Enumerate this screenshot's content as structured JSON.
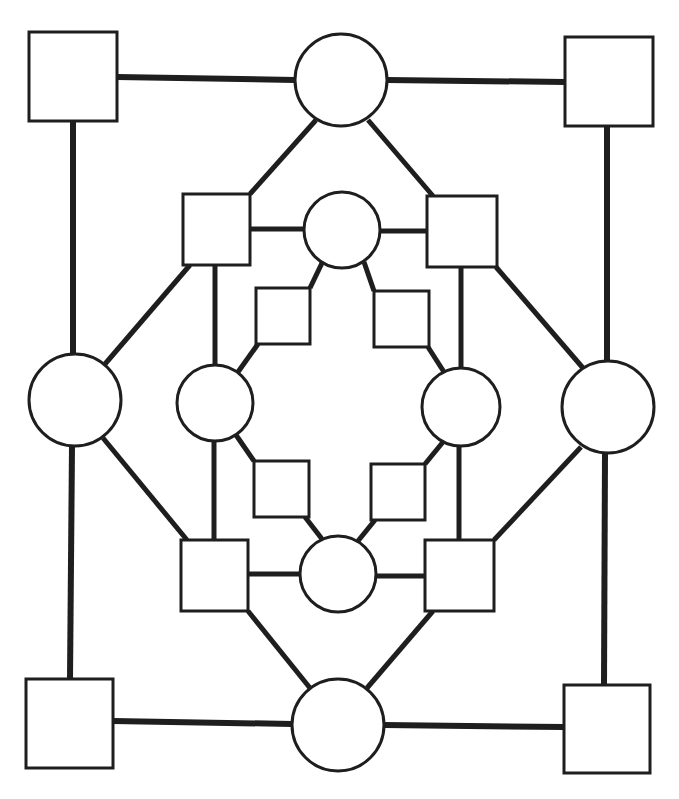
{
  "diagram": {
    "title": "",
    "background": "#ffffff",
    "stroke_color": "#1e1e1e",
    "nodes": [
      {
        "id": "sq-outer-tl",
        "shape": "square",
        "x": 29,
        "y": 32,
        "w": 88,
        "h": 89
      },
      {
        "id": "ci-outer-top",
        "shape": "circle",
        "cx": 341,
        "cy": 80,
        "r": 46
      },
      {
        "id": "sq-outer-tr",
        "shape": "square",
        "x": 565,
        "y": 37,
        "w": 88,
        "h": 89
      },
      {
        "id": "ci-outer-left",
        "shape": "circle",
        "cx": 75,
        "cy": 400,
        "r": 46
      },
      {
        "id": "ci-outer-right",
        "shape": "circle",
        "cx": 608,
        "cy": 407,
        "r": 46
      },
      {
        "id": "sq-outer-bl",
        "shape": "square",
        "x": 26,
        "y": 679,
        "w": 87,
        "h": 89
      },
      {
        "id": "ci-outer-bottom",
        "shape": "circle",
        "cx": 338,
        "cy": 725,
        "r": 46
      },
      {
        "id": "sq-outer-br",
        "shape": "square",
        "x": 564,
        "y": 685,
        "w": 86,
        "h": 88
      },
      {
        "id": "sq-mid-tl",
        "shape": "square",
        "x": 183,
        "y": 194,
        "w": 67,
        "h": 71
      },
      {
        "id": "ci-mid-top",
        "shape": "circle",
        "cx": 342,
        "cy": 230,
        "r": 38
      },
      {
        "id": "sq-mid-tr",
        "shape": "square",
        "x": 427,
        "y": 196,
        "w": 70,
        "h": 71
      },
      {
        "id": "ci-mid-left",
        "shape": "circle",
        "cx": 215,
        "cy": 403,
        "r": 38
      },
      {
        "id": "ci-mid-right",
        "shape": "circle",
        "cx": 461,
        "cy": 407,
        "r": 39
      },
      {
        "id": "sq-mid-bl",
        "shape": "square",
        "x": 181,
        "y": 540,
        "w": 67,
        "h": 71
      },
      {
        "id": "ci-mid-bottom",
        "shape": "circle",
        "cx": 338,
        "cy": 574,
        "r": 38
      },
      {
        "id": "sq-mid-br",
        "shape": "square",
        "x": 425,
        "y": 540,
        "w": 69,
        "h": 71
      },
      {
        "id": "sq-inner-tl",
        "shape": "square",
        "x": 256,
        "y": 288,
        "w": 54,
        "h": 56
      },
      {
        "id": "sq-inner-tr",
        "shape": "square",
        "x": 374,
        "y": 291,
        "w": 55,
        "h": 56
      },
      {
        "id": "sq-inner-bl",
        "shape": "square",
        "x": 254,
        "y": 461,
        "w": 55,
        "h": 56
      },
      {
        "id": "sq-inner-br",
        "shape": "square",
        "x": 371,
        "y": 464,
        "w": 54,
        "h": 56
      }
    ],
    "edges": [
      {
        "from": "sq-outer-tl",
        "to": "ci-outer-top",
        "x1": 117,
        "y1": 77,
        "x2": 295,
        "y2": 80,
        "w": 6
      },
      {
        "from": "ci-outer-top",
        "to": "sq-outer-tr",
        "x1": 387,
        "y1": 80,
        "x2": 565,
        "y2": 82,
        "w": 6
      },
      {
        "from": "sq-outer-tl",
        "to": "ci-outer-left",
        "x1": 73,
        "y1": 121,
        "x2": 73,
        "y2": 354,
        "w": 6
      },
      {
        "from": "sq-outer-tr",
        "to": "ci-outer-right",
        "x1": 607,
        "y1": 126,
        "x2": 607,
        "y2": 361,
        "w": 6
      },
      {
        "from": "ci-outer-left",
        "to": "sq-outer-bl",
        "x1": 72,
        "y1": 446,
        "x2": 70,
        "y2": 679,
        "w": 6
      },
      {
        "from": "ci-outer-right",
        "to": "sq-outer-br",
        "x1": 605,
        "y1": 453,
        "x2": 604,
        "y2": 685,
        "w": 6
      },
      {
        "from": "sq-outer-bl",
        "to": "ci-outer-bottom",
        "x1": 113,
        "y1": 721,
        "x2": 292,
        "y2": 724,
        "w": 6
      },
      {
        "from": "ci-outer-bottom",
        "to": "sq-outer-br",
        "x1": 384,
        "y1": 725,
        "x2": 564,
        "y2": 727,
        "w": 6
      },
      {
        "from": "ci-outer-top",
        "to": "sq-mid-tl",
        "x1": 316,
        "y1": 120,
        "x2": 250,
        "y2": 194,
        "w": 5
      },
      {
        "from": "ci-outer-top",
        "to": "sq-mid-tr",
        "x1": 368,
        "y1": 120,
        "x2": 433,
        "y2": 196,
        "w": 5
      },
      {
        "from": "sq-mid-tl",
        "to": "ci-outer-left",
        "x1": 190,
        "y1": 265,
        "x2": 105,
        "y2": 364,
        "w": 5
      },
      {
        "from": "sq-mid-tr",
        "to": "ci-outer-right",
        "x1": 496,
        "y1": 267,
        "x2": 583,
        "y2": 368,
        "w": 5
      },
      {
        "from": "ci-outer-left",
        "to": "sq-mid-bl",
        "x1": 103,
        "y1": 438,
        "x2": 187,
        "y2": 540,
        "w": 5
      },
      {
        "from": "ci-outer-right",
        "to": "sq-mid-br",
        "x1": 581,
        "y1": 447,
        "x2": 494,
        "y2": 540,
        "w": 5
      },
      {
        "from": "sq-mid-bl",
        "to": "ci-outer-bottom",
        "x1": 248,
        "y1": 611,
        "x2": 310,
        "y2": 688,
        "w": 5
      },
      {
        "from": "sq-mid-br",
        "to": "ci-outer-bottom",
        "x1": 433,
        "y1": 611,
        "x2": 367,
        "y2": 688,
        "w": 5
      },
      {
        "from": "sq-mid-tl",
        "to": "ci-mid-top",
        "x1": 250,
        "y1": 229,
        "x2": 304,
        "y2": 229,
        "w": 5
      },
      {
        "from": "ci-mid-top",
        "to": "sq-mid-tr",
        "x1": 380,
        "y1": 231,
        "x2": 427,
        "y2": 231,
        "w": 5
      },
      {
        "from": "sq-mid-tl",
        "to": "ci-mid-left",
        "x1": 215,
        "y1": 265,
        "x2": 215,
        "y2": 365,
        "w": 5
      },
      {
        "from": "sq-mid-tr",
        "to": "ci-mid-right",
        "x1": 461,
        "y1": 267,
        "x2": 461,
        "y2": 368,
        "w": 5
      },
      {
        "from": "ci-mid-left",
        "to": "sq-mid-bl",
        "x1": 214,
        "y1": 441,
        "x2": 214,
        "y2": 540,
        "w": 5
      },
      {
        "from": "ci-mid-right",
        "to": "sq-mid-br",
        "x1": 459,
        "y1": 446,
        "x2": 459,
        "y2": 540,
        "w": 5
      },
      {
        "from": "sq-mid-bl",
        "to": "ci-mid-bottom",
        "x1": 248,
        "y1": 574,
        "x2": 300,
        "y2": 574,
        "w": 5
      },
      {
        "from": "ci-mid-bottom",
        "to": "sq-mid-br",
        "x1": 376,
        "y1": 576,
        "x2": 425,
        "y2": 576,
        "w": 5
      },
      {
        "from": "ci-mid-top",
        "to": "sq-inner-tl",
        "x1": 322,
        "y1": 263,
        "x2": 310,
        "y2": 288,
        "w": 5
      },
      {
        "from": "ci-mid-top",
        "to": "sq-inner-tr",
        "x1": 364,
        "y1": 262,
        "x2": 374,
        "y2": 291,
        "w": 5
      },
      {
        "from": "sq-inner-tl",
        "to": "ci-mid-left",
        "x1": 258,
        "y1": 344,
        "x2": 238,
        "y2": 372,
        "w": 5
      },
      {
        "from": "sq-inner-tr",
        "to": "ci-mid-right",
        "x1": 428,
        "y1": 347,
        "x2": 444,
        "y2": 372,
        "w": 5
      },
      {
        "from": "ci-mid-left",
        "to": "sq-inner-bl",
        "x1": 236,
        "y1": 435,
        "x2": 254,
        "y2": 461,
        "w": 5
      },
      {
        "from": "ci-mid-right",
        "to": "sq-inner-br",
        "x1": 443,
        "y1": 442,
        "x2": 425,
        "y2": 464,
        "w": 5
      },
      {
        "from": "sq-inner-bl",
        "to": "ci-mid-bottom",
        "x1": 305,
        "y1": 517,
        "x2": 322,
        "y2": 539,
        "w": 5
      },
      {
        "from": "sq-inner-br",
        "to": "ci-mid-bottom",
        "x1": 375,
        "y1": 520,
        "x2": 358,
        "y2": 541,
        "w": 5
      }
    ]
  }
}
